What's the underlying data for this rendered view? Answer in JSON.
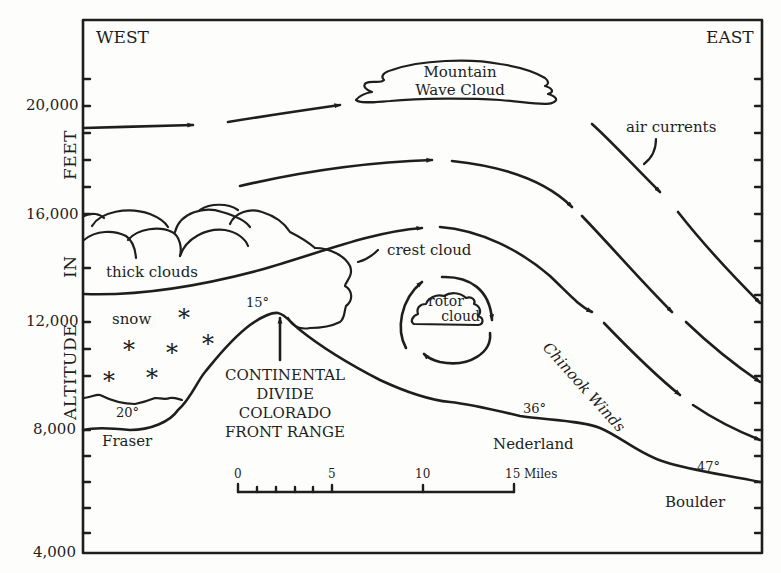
{
  "diagram": {
    "direction_labels": {
      "west": "WEST",
      "east": "EAST"
    },
    "y_axis": {
      "title_parts": [
        "ALTITUDE",
        "IN",
        "FEET"
      ],
      "ticks": [
        "20,000",
        "16,000",
        "12,000",
        "8,000",
        "4,000"
      ],
      "range": [
        4000,
        24000
      ]
    },
    "clouds": {
      "mountain_wave": [
        "Mountain",
        "Wave Cloud"
      ],
      "thick": "thick clouds",
      "crest": "crest cloud",
      "rotor": [
        "rotor",
        "cloud"
      ]
    },
    "labels": {
      "air_currents": "air currents",
      "chinook_winds": "Chinook Winds",
      "snow": "snow",
      "divide": [
        "CONTINENTAL",
        "DIVIDE",
        "COLORADO",
        "FRONT RANGE"
      ]
    },
    "places": [
      {
        "name": "Fraser",
        "temp": "20°"
      },
      {
        "name": "Continental Divide",
        "temp": "15°"
      },
      {
        "name": "Nederland",
        "temp": "36°"
      },
      {
        "name": "Boulder",
        "temp": "47°"
      }
    ],
    "scale_bar": {
      "labels": [
        "0",
        "5",
        "10",
        "15 Miles"
      ]
    },
    "colors": {
      "ink": "#1e1e1e",
      "paper": "#fdfdfb"
    }
  }
}
